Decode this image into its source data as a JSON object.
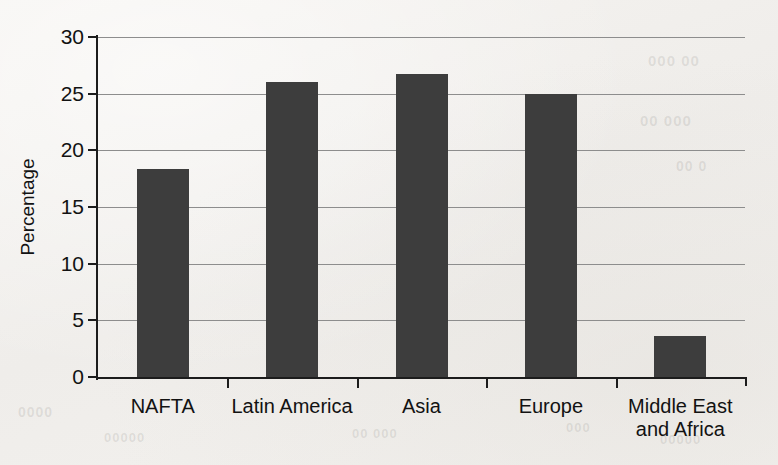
{
  "chart_data": {
    "type": "bar",
    "title": "",
    "subtitle": "",
    "xlabel": "",
    "ylabel": "Percentage",
    "categories": [
      "NAFTA",
      "Latin America",
      "Asia",
      "Europe",
      "Middle East\nand Africa"
    ],
    "values": [
      18.4,
      26.1,
      26.8,
      25.1,
      3.7
    ],
    "ylim": [
      0,
      30
    ],
    "yticks": [
      0,
      5,
      10,
      15,
      20,
      25,
      30
    ],
    "ytick_labels": [
      "0",
      "5",
      "10",
      "15",
      "20",
      "25",
      "30"
    ],
    "grid": true,
    "grid_axis": "y",
    "legend": false,
    "legend_position": "none",
    "bar_color": "#3d3d3d",
    "background_color": "#f3f1ee",
    "axis_color": "#1c1c1c",
    "gridline_color": "#8d8d8d"
  },
  "ghost_text": {
    "items": [
      {
        "text": "000 00",
        "left": 648,
        "top": 52,
        "size": 15
      },
      {
        "text": "00 000",
        "left": 640,
        "top": 112,
        "size": 15
      },
      {
        "text": "00 0",
        "left": 676,
        "top": 158,
        "size": 14
      },
      {
        "text": "0000",
        "left": 18,
        "top": 404,
        "size": 14
      },
      {
        "text": "00000",
        "left": 104,
        "top": 430,
        "size": 13
      },
      {
        "text": "00 000",
        "left": 352,
        "top": 426,
        "size": 13
      },
      {
        "text": "000",
        "left": 566,
        "top": 420,
        "size": 13
      },
      {
        "text": "00000",
        "left": 660,
        "top": 432,
        "size": 13
      }
    ]
  }
}
